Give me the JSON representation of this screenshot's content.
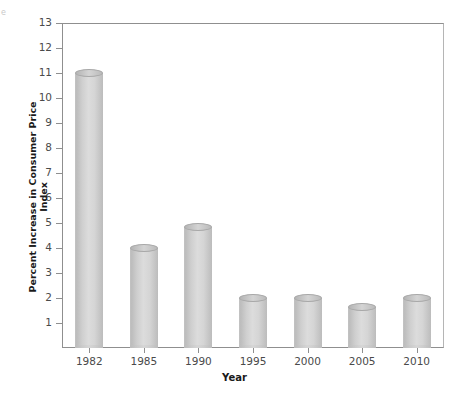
{
  "figure": {
    "corner_mark": "e",
    "background_color": "#ffffff",
    "frame_color": "#8f8f8f",
    "bar_color": "#cccccc",
    "text_color": "#4a4a4a",
    "title_color": "#1a1a1a"
  },
  "chart_data": {
    "type": "bar",
    "title": "",
    "subtitle": "",
    "xlabel": "Year",
    "ylabel": "Percent Increase in Consumer Price Index",
    "categories": [
      "1982",
      "1985",
      "1990",
      "1995",
      "2000",
      "2005",
      "2010"
    ],
    "values": [
      11.0,
      4.0,
      4.85,
      2.0,
      2.0,
      1.65,
      2.0
    ],
    "series": [
      {
        "name": "Percent Increase in Consumer Price Index",
        "values": [
          11.0,
          4.0,
          4.85,
          2.0,
          2.0,
          1.65,
          2.0
        ]
      }
    ],
    "ylim": [
      0,
      13
    ],
    "yticks": [
      1,
      2,
      3,
      4,
      5,
      6,
      7,
      8,
      9,
      10,
      11,
      12,
      13
    ],
    "ytick_labels": [
      "1",
      "2",
      "3",
      "4",
      "5",
      "6",
      "7",
      "8",
      "9",
      "10",
      "11",
      "12",
      "13"
    ],
    "xtick_labels": [
      "1982",
      "1985",
      "1990",
      "1995",
      "2000",
      "2005",
      "2010"
    ],
    "grid": false,
    "legend": false,
    "legend_position": "none",
    "bar_style": "cylinder"
  }
}
